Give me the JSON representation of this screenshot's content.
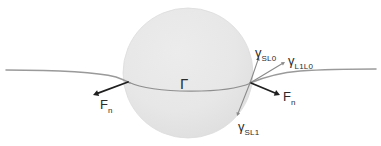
{
  "figure": {
    "background_color": "#ffffff",
    "width": 381,
    "height": 146
  },
  "colors": {
    "sphere_fill": "#e6e6e6",
    "sphere_edge": "#d8d8d8",
    "interface_line": "#9a9a9a",
    "contact_arc": "#8f8f8f",
    "arrow_dark": "#1f1f1f",
    "arrow_light": "#8a8a8a",
    "text": "#2b2b2b"
  },
  "shapes": {
    "sphere": {
      "name": "particle-sphere",
      "cx": 188,
      "cy": 73,
      "r": 65,
      "fill": "#e6e6e6"
    },
    "interface_left": {
      "name": "liquid-interface-left",
      "path": "M 6 70 C 50 70, 92 71, 116 77 C 122 79, 126 81, 130 83"
    },
    "interface_right": {
      "name": "liquid-interface-right",
      "path": "M 250 83 C 262 78, 276 73, 300 71 C 330 69, 358 69, 376 69"
    },
    "contact_arc": {
      "name": "contact-line-arc",
      "path": "M 128 82 C 155 94, 225 94, 251 83"
    }
  },
  "arrows": [
    {
      "name": "arrow-fn-left",
      "label_key": "fn_left",
      "x1": 128,
      "y1": 82,
      "x2": 93,
      "y2": 95,
      "color": "#1f1f1f",
      "width": 1.8,
      "head": 5.5
    },
    {
      "name": "arrow-gamma-sl0",
      "label_key": "gamma_sl0",
      "x1": 250,
      "y1": 83,
      "x2": 259,
      "y2": 57,
      "color": "#8a8a8a",
      "width": 1.1,
      "head": 3.6
    },
    {
      "name": "arrow-gamma-l1l0",
      "label_key": "gamma_l1l0",
      "x1": 250,
      "y1": 83,
      "x2": 285,
      "y2": 62,
      "color": "#8a8a8a",
      "width": 1.1,
      "head": 3.6
    },
    {
      "name": "arrow-fn-right",
      "label_key": "fn_right",
      "x1": 251,
      "y1": 83,
      "x2": 280,
      "y2": 95,
      "color": "#1f1f1f",
      "width": 1.8,
      "head": 5.5
    },
    {
      "name": "arrow-gamma-sl1",
      "label_key": "gamma_sl1",
      "x1": 250,
      "y1": 83,
      "x2": 237,
      "y2": 116,
      "color": "#8a8a8a",
      "width": 1.1,
      "head": 3.6
    }
  ],
  "labels": {
    "gamma_sl0": {
      "base": "γ",
      "sub": "SL0"
    },
    "gamma_l1l0": {
      "base": "γ",
      "sub": "L1L0"
    },
    "gamma_sl1": {
      "base": "γ",
      "sub": "SL1"
    },
    "fn_left": {
      "base": "F",
      "sub": "n"
    },
    "fn_right": {
      "base": "F",
      "sub": "n"
    },
    "contact_line": {
      "base": "Γ",
      "sub": ""
    }
  }
}
